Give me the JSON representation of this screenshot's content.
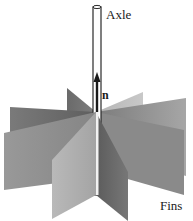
{
  "figure": {
    "type": "diagram",
    "labels": {
      "axle": "Axle",
      "normal_vector": "n",
      "fins": "Fins"
    },
    "colors": {
      "background": "#ffffff",
      "fin_dark": "#6e6e6e",
      "fin_mid": "#8c8c8c",
      "fin_light": "#b0b0b0",
      "axle_outline": "#2a2a2a"
    },
    "components": [
      {
        "name": "axle",
        "description": "vertical hollow cylinder"
      },
      {
        "name": "normal-vector-arrow",
        "description": "arrow pointing up along the axle"
      },
      {
        "name": "fins",
        "count": 8,
        "description": "rectangular vanes radiating from the axle"
      }
    ]
  }
}
